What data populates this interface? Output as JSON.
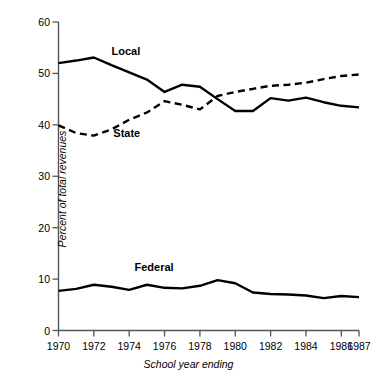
{
  "chart_data": {
    "type": "line",
    "title": "",
    "xlabel": "School year ending",
    "ylabel": "Percent of total revenues",
    "xlim": [
      1970,
      1987
    ],
    "ylim": [
      0,
      60
    ],
    "grid": false,
    "legend_position": "inline-labels",
    "x": [
      1970,
      1971,
      1972,
      1973,
      1974,
      1975,
      1976,
      1977,
      1978,
      1979,
      1980,
      1981,
      1982,
      1983,
      1984,
      1985,
      1986,
      1987
    ],
    "xticks": [
      "1970",
      "1972",
      "1974",
      "1976",
      "1978",
      "1980",
      "1982",
      "1984",
      "1986",
      "1987"
    ],
    "xtick_values": [
      1970,
      1972,
      1974,
      1976,
      1978,
      1980,
      1982,
      1984,
      1986,
      1987
    ],
    "yticks": [
      "0",
      "10",
      "20",
      "30",
      "40",
      "50",
      "60"
    ],
    "ytick_values": [
      0,
      10,
      20,
      30,
      40,
      50,
      60
    ],
    "series": [
      {
        "name": "Local",
        "style": "solid",
        "color": "#000000",
        "label_x": 1973.0,
        "label_y": 54.2,
        "values": [
          52.0,
          52.5,
          53.1,
          51.6,
          50.2,
          48.8,
          46.4,
          47.8,
          47.4,
          45.0,
          42.7,
          42.7,
          45.2,
          44.7,
          45.3,
          44.4,
          43.7,
          43.4
        ]
      },
      {
        "name": "State",
        "style": "dashed",
        "color": "#000000",
        "label_x": 1973.1,
        "label_y": 38.2,
        "values": [
          39.9,
          38.4,
          37.9,
          39.1,
          41.0,
          42.4,
          44.6,
          43.9,
          43.0,
          45.6,
          46.4,
          47.0,
          47.6,
          47.8,
          48.2,
          48.9,
          49.5,
          49.8
        ]
      },
      {
        "name": "Federal",
        "style": "solid",
        "color": "#000000",
        "label_x": 1974.3,
        "label_y": 12.2,
        "values": [
          7.7,
          8.1,
          8.9,
          8.5,
          7.9,
          8.9,
          8.3,
          8.2,
          8.7,
          9.8,
          9.2,
          7.4,
          7.1,
          7.0,
          6.8,
          6.3,
          6.7,
          6.5
        ]
      }
    ]
  },
  "axes": {
    "y_title": "Percent of total revenues",
    "x_title": "School year ending"
  }
}
